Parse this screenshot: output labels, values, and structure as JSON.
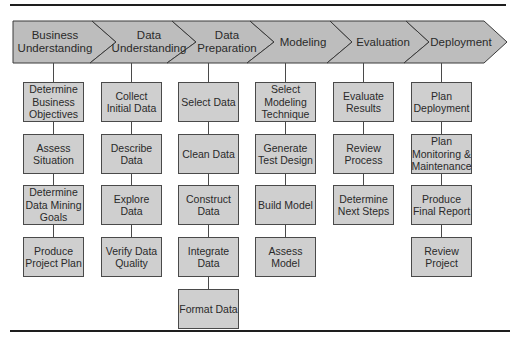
{
  "diagram": {
    "colors": {
      "banner_fill": "#bdbdbd",
      "banner_stroke": "#3a3a3a",
      "task_fill": "#cfcfcf",
      "task_stroke": "#4a4a4a",
      "rule": "#1e1e1e"
    },
    "phases": [
      {
        "label": "Business Understanding",
        "tasks": [
          "Determine Business Objectives",
          "Assess Situation",
          "Determine Data Mining Goals",
          "Produce Project Plan"
        ]
      },
      {
        "label": "Data Understanding",
        "tasks": [
          "Collect Initial Data",
          "Describe Data",
          "Explore Data",
          "Verify Data Quality"
        ]
      },
      {
        "label": "Data Preparation",
        "tasks": [
          "Select Data",
          "Clean Data",
          "Construct Data",
          "Integrate Data",
          "Format Data"
        ]
      },
      {
        "label": "Modeling",
        "tasks": [
          "Select Modeling Technique",
          "Generate Test Design",
          "Build Model",
          "Assess Model"
        ]
      },
      {
        "label": "Evaluation",
        "tasks": [
          "Evaluate Results",
          "Review Process",
          "Determine Next Steps"
        ]
      },
      {
        "label": "Deployment",
        "tasks": [
          "Plan Deployment",
          "Plan Monitoring & Maintenance",
          "Produce Final Report",
          "Review Project"
        ]
      }
    ]
  }
}
